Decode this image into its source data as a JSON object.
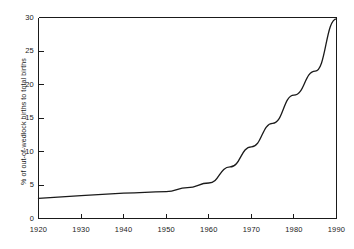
{
  "chart_data": {
    "type": "line",
    "title": "",
    "xlabel": "",
    "ylabel": "% of out-of-wedlock births to total births",
    "xlim": [
      1920,
      1990
    ],
    "ylim": [
      0,
      30
    ],
    "grid": false,
    "legend": null,
    "xticks": [
      1920,
      1930,
      1940,
      1950,
      1960,
      1970,
      1980,
      1990
    ],
    "xtick_labels": [
      "1920",
      "1930",
      "1940",
      "1950",
      "1960",
      "1970",
      "1980",
      "1990"
    ],
    "yticks": [
      0,
      5,
      10,
      15,
      20,
      25,
      30
    ],
    "ytick_labels": [
      "0",
      "5",
      "10",
      "15",
      "20",
      "25",
      "30"
    ],
    "series": [
      {
        "name": "out-of-wedlock births",
        "color": "#1a1a1a",
        "x": [
          1920,
          1930,
          1940,
          1950,
          1955,
          1960,
          1965,
          1970,
          1975,
          1980,
          1985,
          1990
        ],
        "y": [
          3.0,
          3.4,
          3.8,
          4.0,
          4.6,
          5.3,
          7.7,
          10.7,
          14.2,
          18.4,
          22.0,
          29.8
        ]
      }
    ]
  },
  "axes": {
    "frame_color": "#1a1a1a",
    "background": "#ffffff"
  }
}
